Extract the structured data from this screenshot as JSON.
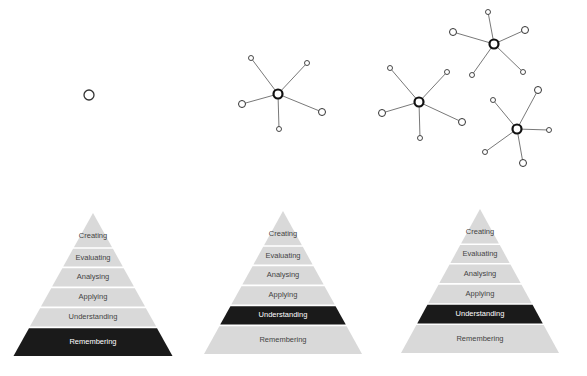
{
  "diagram": {
    "type": "bloom-taxonomy-progression",
    "colors": {
      "band_fill": "#d9d9d9",
      "highlight_fill": "#1a1a1a",
      "band_text": "#444444",
      "highlight_text": "#ffffff",
      "node_stroke": "#333333",
      "hub_stroke": "#111111",
      "edge": "#555555"
    },
    "levels": [
      "Creating",
      "Evaluating",
      "Analysing",
      "Applying",
      "Understanding",
      "Remembering"
    ],
    "panels": [
      {
        "id": "panel-1",
        "network": "single-node",
        "highlighted_level": "Remembering",
        "pyramid": {
          "labels": [
            "Creating",
            "Evaluating",
            "Analysing",
            "Applying",
            "Understanding",
            "Remembering"
          ]
        }
      },
      {
        "id": "panel-2",
        "network": "one-hub-star",
        "highlighted_level": "Understanding",
        "pyramid": {
          "labels": [
            "Creating",
            "Evaluating",
            "Analysing",
            "Applying",
            "Understanding",
            "Remembering"
          ]
        }
      },
      {
        "id": "panel-3",
        "network": "three-hub-stars",
        "highlighted_level": "Understanding",
        "pyramid": {
          "labels": [
            "Creating",
            "Evaluating",
            "Analysing",
            "Applying",
            "Understanding",
            "Remembering"
          ]
        }
      }
    ]
  }
}
